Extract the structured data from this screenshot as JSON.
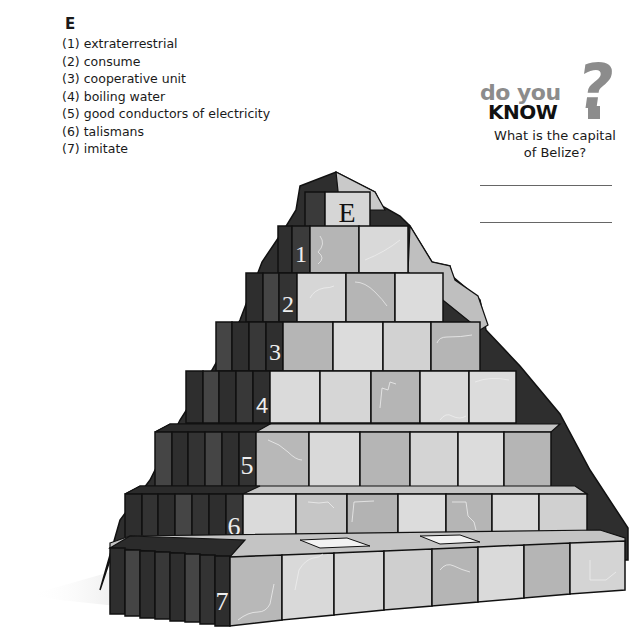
{
  "clues": {
    "heading": "E",
    "items": [
      {
        "num": "(1)",
        "text": "extraterrestrial"
      },
      {
        "num": "(2)",
        "text": "consume"
      },
      {
        "num": "(3)",
        "text": "cooperative unit"
      },
      {
        "num": "(4)",
        "text": "boiling water"
      },
      {
        "num": "(5)",
        "text": "good conductors of electricity"
      },
      {
        "num": "(6)",
        "text": "talismans"
      },
      {
        "num": "(7)",
        "text": "imitate"
      }
    ]
  },
  "do_you_know": {
    "logo_line1": "do you",
    "logo_line2": "KNOW",
    "logo_mark": "?",
    "question_line1": "What is the capital",
    "question_line2": "of Belize?",
    "answer_lines": 2
  },
  "pyramid": {
    "top_letter": "E",
    "rows": [
      {
        "label": "1",
        "blocks": 2
      },
      {
        "label": "2",
        "blocks": 3
      },
      {
        "label": "3",
        "blocks": 4
      },
      {
        "label": "4",
        "blocks": 5
      },
      {
        "label": "5",
        "blocks": 6
      },
      {
        "label": "6",
        "blocks": 7
      },
      {
        "label": "7",
        "blocks": 8
      }
    ]
  },
  "colors": {
    "ink": "#1a1a1a",
    "block_light": "#d9d9d9",
    "block_mid": "#b3b3b3",
    "side_dark": "#3a3a3a",
    "logo_gray": "#8c8c8c"
  }
}
